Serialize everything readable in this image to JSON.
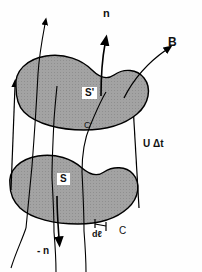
{
  "figure": {
    "colors": {
      "surface_fill": "#9e9e9e",
      "surface_stroke": "#000000",
      "line": "#000000",
      "background": "#ffffff",
      "label_box": "#ffffff"
    },
    "labels": {
      "normal_up": "n",
      "normal_down": "- n",
      "field": "B",
      "surface_upper": "S'",
      "surface_lower": "S",
      "curve_upper": "C'",
      "curve_lower": "C",
      "displacement": "U Δt",
      "line_element": "dℓ"
    },
    "elements": {
      "upper_surface_name": "upper-surface-S-prime",
      "lower_surface_name": "lower-surface-S",
      "field_line_count": 4,
      "connector_count": 2
    }
  }
}
